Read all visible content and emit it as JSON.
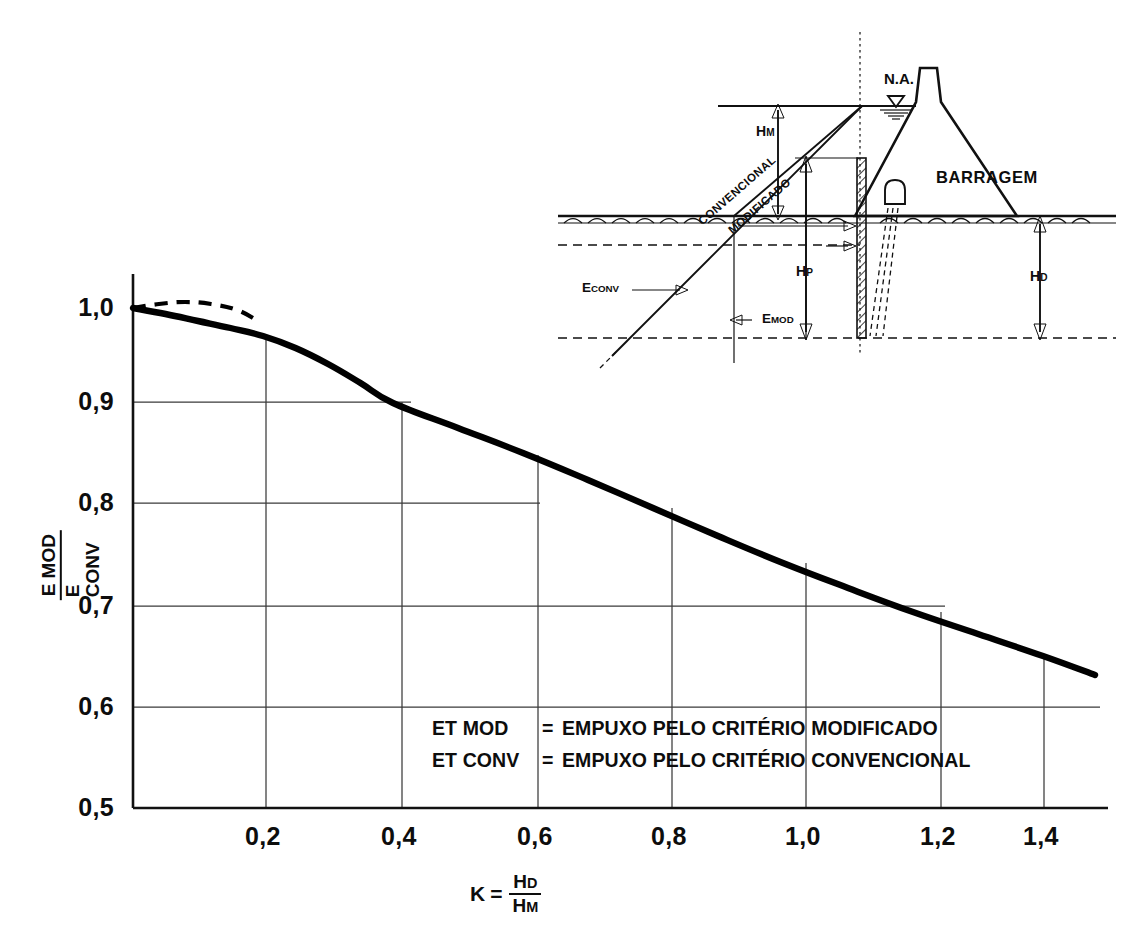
{
  "chart_data": {
    "type": "line",
    "title": "",
    "xlabel": "K = HD / HM",
    "ylabel": "E MOD / E CONV",
    "xlim": [
      0.0,
      1.5
    ],
    "ylim": [
      0.5,
      1.0
    ],
    "grid": true,
    "legend_position": "inside-bottom-center",
    "xticks": [
      "0,2",
      "0,4",
      "0,6",
      "0,8",
      "1,0",
      "1,2",
      "1,4"
    ],
    "xtick_values": [
      0.2,
      0.4,
      0.6,
      0.8,
      1.0,
      1.2,
      1.4
    ],
    "yticks": [
      "1,0",
      "0,9",
      "0,8",
      "0,7",
      "0,6",
      "0,5"
    ],
    "ytick_values": [
      1.0,
      0.9,
      0.8,
      0.7,
      0.6,
      0.5
    ],
    "series": [
      {
        "name": "E MOD / E CONV (solid)",
        "style": "solid",
        "x": [
          0.0,
          0.05,
          0.1,
          0.15,
          0.2,
          0.25,
          0.3,
          0.35,
          0.4,
          0.5,
          0.6,
          0.7,
          0.8,
          0.9,
          1.0,
          1.1,
          1.2,
          1.3,
          1.4,
          1.48
        ],
        "values": [
          1.0,
          0.994,
          0.987,
          0.98,
          0.972,
          0.96,
          0.944,
          0.925,
          0.905,
          0.88,
          0.855,
          0.828,
          0.8,
          0.772,
          0.745,
          0.72,
          0.696,
          0.674,
          0.652,
          0.633
        ]
      },
      {
        "name": "extrapolated (dashed)",
        "style": "dashed",
        "x": [
          0.0,
          0.04,
          0.08,
          0.12,
          0.16,
          0.19
        ],
        "values": [
          1.0,
          1.004,
          1.006,
          1.004,
          0.998,
          0.988
        ]
      }
    ]
  },
  "axis": {
    "y_label_numerator": "E MOD",
    "y_label_denominator": "E CONV",
    "x_label_k": "K",
    "x_label_equals": "=",
    "x_label_numerator_main": "H",
    "x_label_numerator_sub": "D",
    "x_label_denominator_main": "H",
    "x_label_denominator_sub": "M"
  },
  "legend": {
    "rows": [
      {
        "key": "ET MOD",
        "eq": "=",
        "value": "EMPUXO PELO CRITÉRIO MODIFICADO"
      },
      {
        "key": "ET CONV",
        "eq": "=",
        "value": "EMPUXO PELO CRITÉRIO CONVENCIONAL"
      }
    ]
  },
  "diagram": {
    "dam_label": "BARRAGEM",
    "water_level_label": "N.A.",
    "height_hm": "H",
    "height_hm_sub": "M",
    "height_hp": "H",
    "height_hp_sub": "P",
    "height_hd": "H",
    "height_hd_sub": "D",
    "force_conv": "E",
    "force_conv_sub": "CONV",
    "force_mod": "E",
    "force_mod_sub": "MOD",
    "line_conventional": "CONVENCIONAL",
    "line_modified": "MODIFICADO"
  },
  "colors": {
    "ink": "#111111",
    "grid": "#3a3a3a",
    "background": "#ffffff"
  }
}
